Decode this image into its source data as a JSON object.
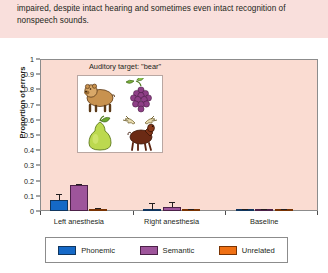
{
  "intro": {
    "text": "impaired, despite intact hearing and sometimes even intact recognition of nonspeech sounds."
  },
  "figure": {
    "stimulus_panel": {
      "title": "Auditory target: \"bear\"",
      "pictures": [
        {
          "name": "bear",
          "position": "top-left"
        },
        {
          "name": "grapes",
          "position": "top-right"
        },
        {
          "name": "pear",
          "position": "bottom-left"
        },
        {
          "name": "moose",
          "position": "bottom-right"
        }
      ]
    },
    "legend": {
      "items": [
        {
          "label": "Phonemic",
          "color": "#1569c7"
        },
        {
          "label": "Semantic",
          "color": "#9e559b"
        },
        {
          "label": "Unrelated",
          "color": "#ef7014"
        }
      ]
    }
  },
  "chart_data": {
    "type": "bar",
    "title": "",
    "xlabel": "",
    "ylabel": "Proportion of errors",
    "categories": [
      "Left anesthesia",
      "Right anesthesia",
      "Baseline"
    ],
    "ylim": [
      0,
      1
    ],
    "yticks": [
      0,
      0.1,
      0.2,
      0.3,
      0.4,
      0.5,
      0.6,
      0.7,
      0.8,
      0.9,
      1
    ],
    "ytick_labels": [
      "0",
      "0.1",
      "0.2",
      "0.3",
      "0.4",
      "0.5",
      "0.6",
      "0.7",
      "0.8",
      "0.9",
      "1"
    ],
    "grid": false,
    "legend_position": "bottom",
    "series": [
      {
        "name": "Phonemic",
        "color": "#1569c7",
        "values": [
          0.075,
          0.005,
          0.004
        ],
        "errors": [
          0.035,
          0.045,
          0.005
        ]
      },
      {
        "name": "Semantic",
        "color": "#9e559b",
        "values": [
          0.17,
          0.028,
          0.004
        ],
        "errors": [
          0.008,
          0.032,
          0.004
        ]
      },
      {
        "name": "Unrelated",
        "color": "#ef7014",
        "values": [
          0.016,
          0.005,
          0.002
        ],
        "errors": [
          0.007,
          0.004,
          0.002
        ]
      }
    ]
  }
}
